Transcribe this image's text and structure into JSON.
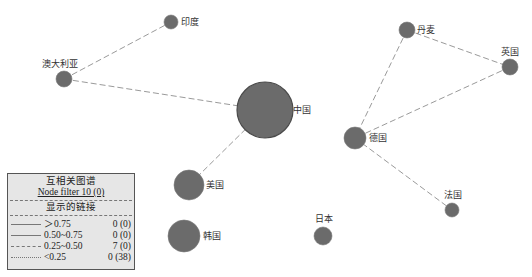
{
  "graph": {
    "node_color": "#6b6b6b",
    "edge_color": "#9a9a9a",
    "nodes": [
      {
        "id": "india",
        "label": "印度",
        "x": 171,
        "y": 22,
        "r": 7,
        "lx": 181,
        "ly": 25
      },
      {
        "id": "australia",
        "label": "澳大利亚",
        "x": 64,
        "y": 79,
        "r": 8,
        "lx": 42,
        "ly": 67
      },
      {
        "id": "china",
        "label": "中国",
        "x": 265,
        "y": 110,
        "r": 28,
        "lx": 293,
        "ly": 113
      },
      {
        "id": "usa",
        "label": "美国",
        "x": 189,
        "y": 185,
        "r": 15,
        "lx": 206,
        "ly": 188
      },
      {
        "id": "korea",
        "label": "韩国",
        "x": 184,
        "y": 236,
        "r": 16,
        "lx": 203,
        "ly": 239
      },
      {
        "id": "japan",
        "label": "日本",
        "x": 323,
        "y": 236,
        "r": 9,
        "lx": 315,
        "ly": 222
      },
      {
        "id": "denmark",
        "label": "丹麦",
        "x": 407,
        "y": 30,
        "r": 8,
        "lx": 417,
        "ly": 33
      },
      {
        "id": "uk",
        "label": "英国",
        "x": 510,
        "y": 67,
        "r": 8,
        "lx": 501,
        "ly": 55
      },
      {
        "id": "germany",
        "label": "德国",
        "x": 355,
        "y": 138,
        "r": 11,
        "lx": 369,
        "ly": 141
      },
      {
        "id": "france",
        "label": "法国",
        "x": 452,
        "y": 210,
        "r": 7,
        "lx": 444,
        "ly": 198
      }
    ],
    "edges": [
      {
        "from": "australia",
        "to": "india",
        "weight": "0.25~0.50"
      },
      {
        "from": "australia",
        "to": "china",
        "weight": "0.25~0.50"
      },
      {
        "from": "china",
        "to": "usa",
        "weight": "0.25~0.50"
      },
      {
        "from": "denmark",
        "to": "uk",
        "weight": "0.25~0.50"
      },
      {
        "from": "denmark",
        "to": "germany",
        "weight": "0.25~0.50"
      },
      {
        "from": "uk",
        "to": "germany",
        "weight": "0.25~0.50"
      },
      {
        "from": "germany",
        "to": "france",
        "weight": "0.25~0.50"
      }
    ]
  },
  "legend": {
    "title": "互相关图谱",
    "node_filter": "Node filter 10 (0)",
    "subtitle": "显示的链接",
    "rows": [
      {
        "style": "solid",
        "range": "＞0.75",
        "count": "0 (0)"
      },
      {
        "style": "solid",
        "range": "0.50~0.75",
        "count": "0 (0)"
      },
      {
        "style": "dashed",
        "range": "0.25~0.50",
        "count": "7 (0)"
      },
      {
        "style": "dotted",
        "range": "<0.25",
        "count": "0 (38)"
      }
    ]
  }
}
